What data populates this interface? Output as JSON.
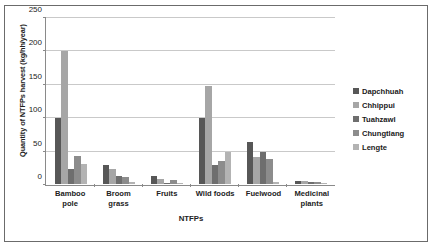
{
  "chart_data": {
    "type": "bar",
    "title": "",
    "xlabel": "NTFPs",
    "ylabel": "Quantity of NTFPs harvest (kg/hh/year)",
    "ylim": [
      0,
      250
    ],
    "ytick_values": [
      0,
      50,
      100,
      150,
      200,
      250
    ],
    "ytick_labels": [
      "0",
      "50",
      "100",
      "150",
      "200",
      "250"
    ],
    "grid": true,
    "legend_position": "right",
    "categories": [
      "Bamboo pole",
      "Broom grass",
      "Fruits",
      "Wild foods",
      "Fuelwood",
      "Medicinal plants"
    ],
    "series": [
      {
        "name": "Dapchhuah",
        "color": "#575757",
        "values": [
          100,
          28,
          12,
          100,
          63,
          4
        ]
      },
      {
        "name": "Chhippui",
        "color": "#a6a6a6",
        "values": [
          200,
          22,
          7,
          148,
          40,
          4
        ]
      },
      {
        "name": "Tuahzawl",
        "color": "#6e6e6e",
        "values": [
          22,
          12,
          2,
          28,
          48,
          3
        ]
      },
      {
        "name": "Chungtlang",
        "color": "#8c8c8c",
        "values": [
          42,
          10,
          6,
          35,
          38,
          3
        ]
      },
      {
        "name": "Lengte",
        "color": "#b3b3b3",
        "values": [
          30,
          3,
          2,
          48,
          3,
          2
        ]
      }
    ]
  },
  "legend": {
    "items": [
      {
        "label": "Dapchhuah"
      },
      {
        "label": "Chhippui"
      },
      {
        "label": "Tuahzawl"
      },
      {
        "label": "Chungtlang"
      },
      {
        "label": "Lengte"
      }
    ]
  },
  "colors": {
    "frame_border": "#6b6b6b",
    "axis_line": "#8a8a8a",
    "gridline": "#c9c9c9",
    "text": "#222222"
  }
}
